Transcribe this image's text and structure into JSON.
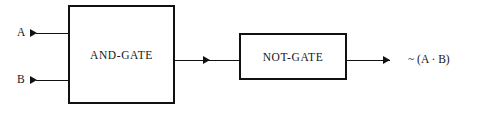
{
  "diagram": {
    "stroke_color": "#111111",
    "text_color": "#161616",
    "background_color": "#ffffff"
  },
  "gates": [
    {
      "id": "and",
      "label": "AND-GATE"
    },
    {
      "id": "not",
      "label": "NOT-GATE"
    }
  ],
  "inputs": [
    {
      "id": "a",
      "label": "A"
    },
    {
      "id": "b",
      "label": "B"
    }
  ],
  "output": {
    "label": "~ (A · B)"
  },
  "icons": {
    "input_arrow_a": "arrowhead-right-icon",
    "input_arrow_b": "arrowhead-right-icon",
    "mid_arrow": "arrowhead-right-icon",
    "output_arrow": "arrowhead-right-icon"
  }
}
